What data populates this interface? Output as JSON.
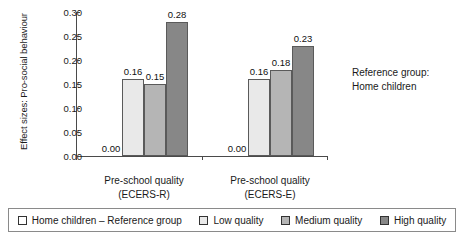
{
  "chart_data": {
    "type": "bar",
    "title": "",
    "xlabel": "",
    "ylabel": "Effect sizes: Pro-social behaviour",
    "ylim": [
      0.0,
      0.3
    ],
    "yticks": [
      "0.00",
      "0.05",
      "0.10",
      "0.15",
      "0.20",
      "0.25",
      "0.30"
    ],
    "grid": false,
    "legend_position": "bottom",
    "groups": [
      {
        "label_line1": "Pre-school quality",
        "label_line2": "(ECERS-R)",
        "bars": [
          {
            "series": "Home children – Reference group",
            "value": 0.0,
            "label": "0.00",
            "style": "none"
          },
          {
            "series": "Low quality",
            "value": 0.16,
            "label": "0.16",
            "style": "light"
          },
          {
            "series": "Medium quality",
            "value": 0.15,
            "label": "0.15",
            "style": "medium"
          },
          {
            "series": "High quality",
            "value": 0.28,
            "label": "0.28",
            "style": "dark"
          }
        ]
      },
      {
        "label_line1": "Pre-school quality",
        "label_line2": "(ECERS-E)",
        "bars": [
          {
            "series": "Home children – Reference group",
            "value": 0.0,
            "label": "0.00",
            "style": "none"
          },
          {
            "series": "Low quality",
            "value": 0.16,
            "label": "0.16",
            "style": "light"
          },
          {
            "series": "Medium quality",
            "value": 0.18,
            "label": "0.18",
            "style": "medium"
          },
          {
            "series": "High quality",
            "value": 0.23,
            "label": "0.23",
            "style": "dark"
          }
        ]
      }
    ],
    "categories": [
      "Pre-school quality (ECERS-R)",
      "Pre-school quality (ECERS-E)"
    ],
    "series": [
      {
        "name": "Home children – Reference group",
        "values": [
          0.0,
          0.0
        ],
        "style": "none"
      },
      {
        "name": "Low quality",
        "values": [
          0.16,
          0.16
        ],
        "style": "light"
      },
      {
        "name": "Medium quality",
        "values": [
          0.15,
          0.18
        ],
        "style": "medium"
      },
      {
        "name": "High quality",
        "values": [
          0.28,
          0.23
        ],
        "style": "dark"
      }
    ],
    "annotation": {
      "line1": "Reference group:",
      "line2": "Home children"
    },
    "legend": [
      {
        "label": "Home children  – Reference group",
        "style": "empty"
      },
      {
        "label": "Low quality",
        "style": "light"
      },
      {
        "label": "Medium quality",
        "style": "medium"
      },
      {
        "label": "High quality",
        "style": "dark"
      }
    ],
    "colors": {
      "light": "#e9e9e9",
      "medium": "#b5b5b5",
      "dark": "#878787",
      "axis": "#4a4a4a",
      "text": "#1a1a1a"
    }
  }
}
